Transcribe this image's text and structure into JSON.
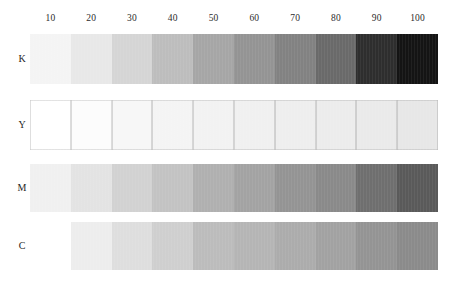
{
  "chart_data": {
    "type": "heatmap",
    "xlabel": "",
    "ylabel": "",
    "grid": false,
    "legend": "none",
    "categories": [
      "10",
      "20",
      "30",
      "40",
      "50",
      "60",
      "70",
      "80",
      "90",
      "100"
    ],
    "row_keys": [
      "K",
      "Y",
      "M",
      "C"
    ],
    "series": [
      {
        "name": "K",
        "label": "K",
        "values": [
          10,
          20,
          30,
          40,
          50,
          60,
          70,
          80,
          90,
          100
        ],
        "colors": [
          "#f4f4f4",
          "#e8e8e8",
          "#d5d5d5",
          "#bdbdbd",
          "#a6a6a6",
          "#949494",
          "#828282",
          "#6a6a6a",
          "#2e2e2e",
          "#141414"
        ],
        "bordered": false
      },
      {
        "name": "Y",
        "label": "Y",
        "values": [
          10,
          20,
          30,
          40,
          50,
          60,
          70,
          80,
          90,
          100
        ],
        "colors": [
          "#ffffff",
          "#fcfcfc",
          "#f7f7f7",
          "#f4f4f4",
          "#f2f2f2",
          "#f0f0f0",
          "#eeeeee",
          "#ececec",
          "#eaeaea",
          "#e7e7e7"
        ],
        "bordered": true
      },
      {
        "name": "M",
        "label": "M",
        "values": [
          10,
          20,
          30,
          40,
          50,
          60,
          70,
          80,
          90,
          100
        ],
        "colors": [
          "#f0f0f0",
          "#e3e3e3",
          "#d2d2d2",
          "#c3c3c3",
          "#b0b0b0",
          "#a3a3a3",
          "#949494",
          "#8a8a8a",
          "#6f6f6f",
          "#5a5a5a"
        ],
        "bordered": false
      },
      {
        "name": "C",
        "label": "C",
        "values": [
          10,
          20,
          30,
          40,
          50,
          60,
          70,
          80,
          90,
          100
        ],
        "colors": [
          "#ffffff",
          "#ededed",
          "#dedede",
          "#cfcfcf",
          "#bcbcbc",
          "#b5b5b5",
          "#acacac",
          "#a2a2a2",
          "#949494",
          "#8b8b8b"
        ],
        "bordered": false
      }
    ]
  },
  "scale": {
    "ticks": [
      "10",
      "20",
      "30",
      "40",
      "50",
      "60",
      "70",
      "80",
      "90",
      "100"
    ]
  },
  "rows": [
    {
      "label": "K"
    },
    {
      "label": "Y"
    },
    {
      "label": "M"
    },
    {
      "label": "C"
    }
  ]
}
